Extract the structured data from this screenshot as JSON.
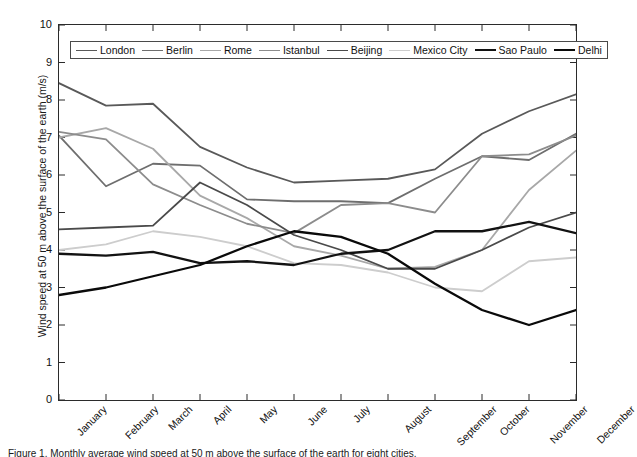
{
  "figure": {
    "caption": "Figure 1. Monthly average wind speed at 50 m above the surface of the earth for eight cities."
  },
  "axes": {
    "ylabel": "Wind speed at 50 m above the surface of the earth (m/s)",
    "xlabel": "",
    "yticks": [
      "0",
      "1",
      "2",
      "3",
      "4",
      "5",
      "6",
      "7",
      "8",
      "9",
      "10"
    ],
    "xticks": [
      "January",
      "February",
      "March",
      "April",
      "May",
      "June",
      "July",
      "August",
      "September",
      "October",
      "November",
      "December"
    ]
  },
  "legend": {
    "position": "top-inside",
    "entries": [
      {
        "label": "London",
        "color": "#595959",
        "width": 1.8
      },
      {
        "label": "Berlin",
        "color": "#6e6e6e",
        "width": 1.8
      },
      {
        "label": "Rome",
        "color": "#a8a8a8",
        "width": 1.8
      },
      {
        "label": "Istanbul",
        "color": "#8c8c8c",
        "width": 1.8
      },
      {
        "label": "Beijing",
        "color": "#4a4a4a",
        "width": 1.8
      },
      {
        "label": "Mexico City",
        "color": "#cdcdcd",
        "width": 1.8
      },
      {
        "label": "Sao Paulo",
        "color": "#121212",
        "width": 2.3
      },
      {
        "label": "Delhi",
        "color": "#0a0a0a",
        "width": 2.3
      }
    ]
  },
  "chart_data": {
    "type": "line",
    "title": "",
    "xlabel": "",
    "ylabel": "Wind speed at 50 m above the surface of the earth (m/s)",
    "categories": [
      "January",
      "February",
      "March",
      "April",
      "May",
      "June",
      "July",
      "August",
      "September",
      "October",
      "November",
      "December"
    ],
    "ylim": [
      0,
      10
    ],
    "ytick_step": 1,
    "grid": false,
    "legend_position": "top-inside",
    "series": [
      {
        "name": "London",
        "color": "#595959",
        "width": 1.8,
        "values": [
          8.45,
          7.85,
          7.9,
          6.75,
          6.2,
          5.8,
          5.85,
          5.9,
          6.15,
          7.1,
          7.7,
          8.15
        ]
      },
      {
        "name": "Berlin",
        "color": "#6e6e6e",
        "width": 1.8,
        "values": [
          7.05,
          5.7,
          6.3,
          6.25,
          5.35,
          5.3,
          5.3,
          5.25,
          5.9,
          6.5,
          6.4,
          7.1
        ]
      },
      {
        "name": "Rome",
        "color": "#a8a8a8",
        "width": 1.8,
        "values": [
          7.0,
          7.25,
          6.7,
          5.45,
          4.85,
          4.1,
          3.85,
          3.5,
          3.55,
          4.0,
          5.6,
          6.65
        ]
      },
      {
        "name": "Istanbul",
        "color": "#8c8c8c",
        "width": 1.8,
        "values": [
          7.15,
          6.95,
          5.75,
          5.2,
          4.7,
          4.45,
          5.2,
          5.25,
          5.0,
          6.5,
          6.55,
          7.05
        ]
      },
      {
        "name": "Beijing",
        "color": "#4a4a4a",
        "width": 1.8,
        "values": [
          4.55,
          4.6,
          4.65,
          5.8,
          5.2,
          4.4,
          4.0,
          3.5,
          3.5,
          4.0,
          4.6,
          5.0
        ]
      },
      {
        "name": "Mexico City",
        "color": "#cdcdcd",
        "width": 1.8,
        "values": [
          4.0,
          4.15,
          4.5,
          4.35,
          4.1,
          3.65,
          3.6,
          3.4,
          3.0,
          2.9,
          3.7,
          3.8
        ]
      },
      {
        "name": "Sao Paulo",
        "color": "#121212",
        "width": 2.3,
        "values": [
          3.9,
          3.85,
          3.95,
          3.65,
          3.7,
          3.6,
          3.9,
          4.0,
          4.5,
          4.5,
          4.75,
          4.45
        ]
      },
      {
        "name": "Delhi",
        "color": "#0a0a0a",
        "width": 2.3,
        "values": [
          2.8,
          3.0,
          3.3,
          3.6,
          4.1,
          4.5,
          4.35,
          3.9,
          3.1,
          2.4,
          2.0,
          2.4
        ]
      }
    ]
  }
}
